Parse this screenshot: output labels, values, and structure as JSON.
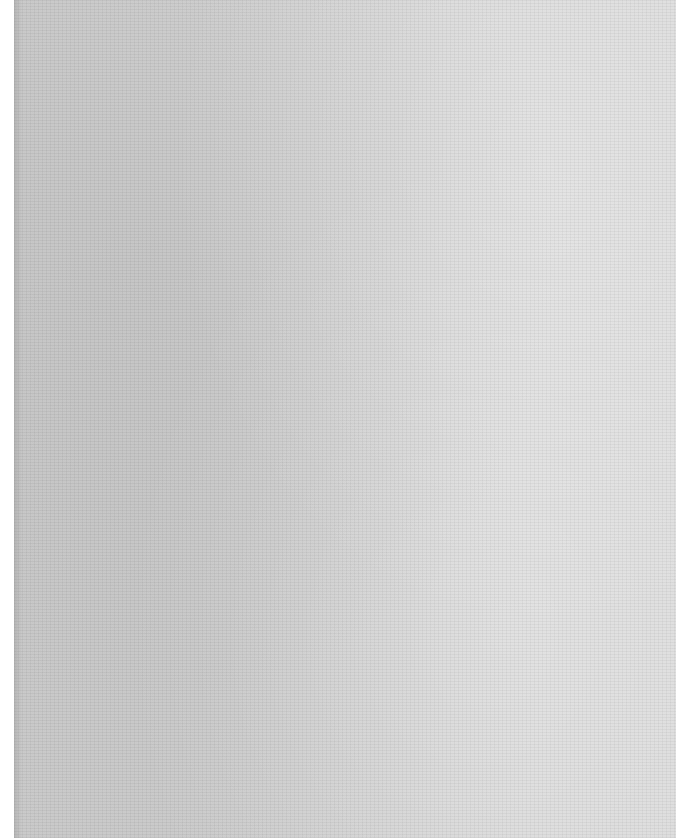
{
  "document": {
    "type": "scanned-page",
    "state": "blank",
    "visible_text": "",
    "colors": {
      "margin": "#ffffff",
      "paper_dark": "#c9c9c9",
      "paper_light": "#d9d9d9"
    }
  }
}
